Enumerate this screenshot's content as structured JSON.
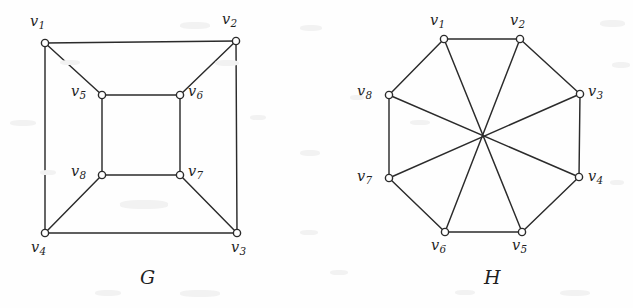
{
  "figure": {
    "background_color": "#fefefe",
    "stroke_color": "#2b2b2b",
    "caption_note": "Two drawings of isomorphic 8-vertex cubic graphs",
    "graphs": [
      {
        "id": "G",
        "name_label": "G",
        "name_pos": {
          "x": 140,
          "y": 268
        },
        "layout": "nested-squares",
        "vertices": [
          {
            "id": "v1",
            "label": "v",
            "sub": "1",
            "x": 45,
            "y": 43,
            "label_x": 30,
            "label_y": 14
          },
          {
            "id": "v2",
            "label": "v",
            "sub": "2",
            "x": 236,
            "y": 41,
            "label_x": 222,
            "label_y": 12
          },
          {
            "id": "v3",
            "label": "v",
            "sub": "3",
            "x": 237,
            "y": 233,
            "label_x": 231,
            "label_y": 240
          },
          {
            "id": "v4",
            "label": "v",
            "sub": "4",
            "x": 45,
            "y": 233,
            "label_x": 31,
            "label_y": 240
          },
          {
            "id": "v5",
            "label": "v",
            "sub": "5",
            "x": 102,
            "y": 95,
            "label_x": 71,
            "label_y": 84
          },
          {
            "id": "v6",
            "label": "v",
            "sub": "6",
            "x": 180,
            "y": 95,
            "label_x": 188,
            "label_y": 84
          },
          {
            "id": "v7",
            "label": "v",
            "sub": "7",
            "x": 180,
            "y": 175,
            "label_x": 188,
            "label_y": 164
          },
          {
            "id": "v8",
            "label": "v",
            "sub": "8",
            "x": 102,
            "y": 175,
            "label_x": 71,
            "label_y": 164
          }
        ],
        "edges": [
          [
            "v1",
            "v2"
          ],
          [
            "v2",
            "v3"
          ],
          [
            "v3",
            "v4"
          ],
          [
            "v4",
            "v1"
          ],
          [
            "v5",
            "v6"
          ],
          [
            "v6",
            "v7"
          ],
          [
            "v7",
            "v8"
          ],
          [
            "v8",
            "v5"
          ],
          [
            "v1",
            "v5"
          ],
          [
            "v2",
            "v6"
          ],
          [
            "v3",
            "v7"
          ],
          [
            "v4",
            "v8"
          ]
        ]
      },
      {
        "id": "H",
        "name_label": "H",
        "name_pos": {
          "x": 484,
          "y": 268
        },
        "layout": "octagon-with-diagonals",
        "vertices": [
          {
            "id": "v1",
            "label": "v",
            "sub": "1",
            "x": 444,
            "y": 39,
            "label_x": 430,
            "label_y": 13
          },
          {
            "id": "v2",
            "label": "v",
            "sub": "2",
            "x": 520,
            "y": 39,
            "label_x": 510,
            "label_y": 13
          },
          {
            "id": "v3",
            "label": "v",
            "sub": "3",
            "x": 580,
            "y": 94,
            "label_x": 588,
            "label_y": 84
          },
          {
            "id": "v4",
            "label": "v",
            "sub": "4",
            "x": 579,
            "y": 177,
            "label_x": 588,
            "label_y": 169
          },
          {
            "id": "v5",
            "label": "v",
            "sub": "5",
            "x": 522,
            "y": 232,
            "label_x": 512,
            "label_y": 238
          },
          {
            "id": "v6",
            "label": "v",
            "sub": "6",
            "x": 445,
            "y": 232,
            "label_x": 431,
            "label_y": 238
          },
          {
            "id": "v7",
            "label": "v",
            "sub": "7",
            "x": 389,
            "y": 178,
            "label_x": 357,
            "label_y": 169
          },
          {
            "id": "v8",
            "label": "v",
            "sub": "8",
            "x": 389,
            "y": 95,
            "label_x": 357,
            "label_y": 84
          }
        ],
        "edges": [
          [
            "v1",
            "v2"
          ],
          [
            "v2",
            "v3"
          ],
          [
            "v3",
            "v4"
          ],
          [
            "v4",
            "v5"
          ],
          [
            "v5",
            "v6"
          ],
          [
            "v6",
            "v7"
          ],
          [
            "v7",
            "v8"
          ],
          [
            "v8",
            "v1"
          ],
          [
            "v1",
            "v5"
          ],
          [
            "v2",
            "v6"
          ],
          [
            "v3",
            "v7"
          ],
          [
            "v4",
            "v8"
          ]
        ]
      }
    ]
  }
}
